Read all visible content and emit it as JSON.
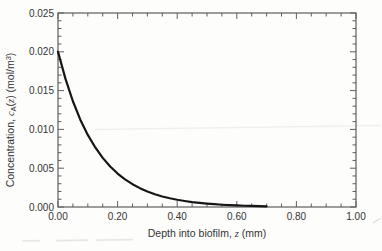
{
  "figure": {
    "background": "#fdfdfc",
    "frame_color": "#5e5e5e",
    "curve_color": "#161616",
    "text_color": "#343434"
  },
  "chart_data": {
    "type": "line",
    "title": "",
    "xlabel": {
      "t1": "Depth into biofilm, ",
      "var": "z",
      "t2": " (mm)"
    },
    "ylabel": {
      "t1": "Concentration, ",
      "var": "c",
      "sub": "A",
      "t2": "(",
      "var2": "z",
      "t3": ") (mol/m",
      "sup": "3",
      "t4": ")"
    },
    "xlim": [
      0.0,
      1.0
    ],
    "ylim": [
      0.0,
      0.025
    ],
    "x_major_step": 0.2,
    "x_minor_step": 0.05,
    "y_major_step": 0.005,
    "y_minor_step": 0.001,
    "x_tick_labels": [
      "0.00",
      "0.20",
      "0.40",
      "0.60",
      "0.80",
      "1.00"
    ],
    "y_tick_labels": [
      "0.000",
      "0.005",
      "0.010",
      "0.015",
      "0.020",
      "0.025"
    ],
    "grid": false,
    "legend": null,
    "series": [
      {
        "name": "concentration-profile",
        "x": [
          0.0,
          0.025,
          0.05,
          0.075,
          0.1,
          0.125,
          0.15,
          0.175,
          0.2,
          0.225,
          0.25,
          0.275,
          0.3,
          0.325,
          0.35,
          0.375,
          0.4,
          0.425,
          0.45,
          0.475,
          0.5,
          0.525,
          0.55,
          0.575,
          0.6,
          0.625,
          0.65,
          0.675,
          0.7
        ],
        "y": [
          0.02,
          0.01651,
          0.01363,
          0.01125,
          0.00929,
          0.00767,
          0.00633,
          0.00523,
          0.00431,
          0.00356,
          0.00294,
          0.00243,
          0.002,
          0.00165,
          0.00136,
          0.00113,
          0.00093,
          0.00077,
          0.00063,
          0.00052,
          0.00043,
          0.00036,
          0.00029,
          0.00024,
          0.0002,
          0.00016,
          0.00014,
          0.00011,
          9e-05
        ]
      }
    ]
  }
}
